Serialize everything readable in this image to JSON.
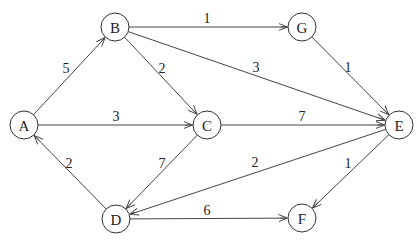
{
  "graph": {
    "directed": true,
    "node_radius": 14,
    "colors": {
      "stroke": "#333333",
      "fill": "#ffffff",
      "text": "#222222"
    },
    "nodes": [
      {
        "id": "A",
        "label": "A",
        "x": 24,
        "y": 125
      },
      {
        "id": "B",
        "label": "B",
        "x": 115,
        "y": 27
      },
      {
        "id": "C",
        "label": "C",
        "x": 207,
        "y": 125
      },
      {
        "id": "D",
        "label": "D",
        "x": 116,
        "y": 219
      },
      {
        "id": "E",
        "label": "E",
        "x": 399,
        "y": 125
      },
      {
        "id": "F",
        "label": "F",
        "x": 302,
        "y": 218
      },
      {
        "id": "G",
        "label": "G",
        "x": 302,
        "y": 27
      }
    ],
    "edges": [
      {
        "from": "A",
        "to": "B",
        "weight": "5",
        "lx": 66,
        "ly": 68
      },
      {
        "from": "A",
        "to": "C",
        "weight": "3",
        "lx": 116,
        "ly": 116
      },
      {
        "from": "B",
        "to": "G",
        "weight": "1",
        "lx": 207,
        "ly": 18
      },
      {
        "from": "B",
        "to": "C",
        "weight": "2",
        "lx": 162,
        "ly": 68
      },
      {
        "from": "B",
        "to": "E",
        "weight": "3",
        "lx": 256,
        "ly": 67
      },
      {
        "from": "G",
        "to": "E",
        "weight": "1",
        "lx": 348,
        "ly": 67
      },
      {
        "from": "C",
        "to": "E",
        "weight": "7",
        "lx": 302,
        "ly": 116
      },
      {
        "from": "C",
        "to": "D",
        "weight": "7",
        "lx": 162,
        "ly": 163
      },
      {
        "from": "D",
        "to": "A",
        "weight": "2",
        "lx": 69,
        "ly": 163
      },
      {
        "from": "E",
        "to": "D",
        "weight": "2",
        "lx": 255,
        "ly": 162
      },
      {
        "from": "E",
        "to": "F",
        "weight": "1",
        "lx": 348,
        "ly": 163
      },
      {
        "from": "D",
        "to": "F",
        "weight": "6",
        "lx": 207,
        "ly": 210
      }
    ]
  }
}
